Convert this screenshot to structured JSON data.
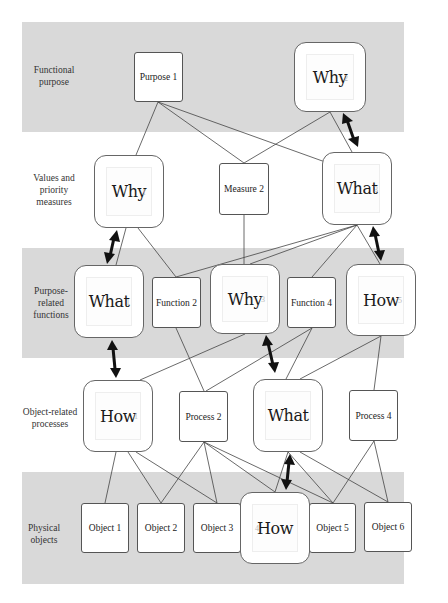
{
  "diagram": {
    "type": "abstraction-hierarchy",
    "levels": [
      {
        "id": "L1",
        "label": "Functional purpose",
        "label_lines": [
          "Functional",
          "purpose"
        ],
        "shaded": true
      },
      {
        "id": "L2",
        "label": "Values and priority measures",
        "label_lines": [
          "Values and",
          "priority",
          "measures"
        ],
        "shaded": false
      },
      {
        "id": "L3",
        "label": "Purpose-related functions",
        "label_lines": [
          "Purpose-",
          "related",
          "functions"
        ],
        "shaded": true
      },
      {
        "id": "L4",
        "label": "Object-related processes",
        "label_lines": [
          "Object-related",
          "processes"
        ],
        "shaded": false
      },
      {
        "id": "L5",
        "label": "Physical objects",
        "label_lines": [
          "Physical",
          "objects"
        ],
        "shaded": true
      }
    ],
    "nodes": {
      "purpose1": {
        "label": "Purpose 1",
        "kind": "plain"
      },
      "purpose2": {
        "label": "Why",
        "ghost": "2",
        "kind": "focus"
      },
      "measure1": {
        "label": "Why",
        "ghost": "1",
        "kind": "focus"
      },
      "measure2": {
        "label": "Measure 2",
        "kind": "plain"
      },
      "measure3": {
        "label": "What",
        "ghost": "3",
        "kind": "focus"
      },
      "function1": {
        "label": "What",
        "ghost": "1",
        "kind": "focus"
      },
      "function2": {
        "label": "Function 2",
        "kind": "plain"
      },
      "function3": {
        "label": "Why",
        "ghost": "3",
        "kind": "focus"
      },
      "function4": {
        "label": "Function 4",
        "kind": "plain"
      },
      "function5": {
        "label": "How",
        "ghost": "5",
        "kind": "focus"
      },
      "process1": {
        "label": "How",
        "ghost": "1",
        "kind": "focus"
      },
      "process2": {
        "label": "Process 2",
        "kind": "plain"
      },
      "process3": {
        "label": "What",
        "ghost": "3",
        "kind": "focus"
      },
      "process4": {
        "label": "Process 4",
        "kind": "plain"
      },
      "object1": {
        "label": "Object 1",
        "kind": "plain"
      },
      "object2": {
        "label": "Object 2",
        "kind": "plain"
      },
      "object3": {
        "label": "Object 3",
        "kind": "plain"
      },
      "object4": {
        "label": "How",
        "ghost": "4",
        "kind": "focus"
      },
      "object5": {
        "label": "Object 5",
        "kind": "plain"
      },
      "object6": {
        "label": "Object 6",
        "kind": "plain"
      }
    },
    "edges": [
      [
        "purpose1",
        "measure1"
      ],
      [
        "purpose1",
        "measure3"
      ],
      [
        "purpose1",
        "measure2"
      ],
      [
        "purpose2",
        "measure2"
      ],
      [
        "purpose2",
        "measure3"
      ],
      [
        "measure1",
        "function1"
      ],
      [
        "measure1",
        "function2"
      ],
      [
        "measure2",
        "function3"
      ],
      [
        "measure3",
        "function2"
      ],
      [
        "measure3",
        "function3"
      ],
      [
        "measure3",
        "function4"
      ],
      [
        "measure3",
        "function5"
      ],
      [
        "function1",
        "process1"
      ],
      [
        "function2",
        "process2"
      ],
      [
        "function3",
        "process1"
      ],
      [
        "function3",
        "process3"
      ],
      [
        "function4",
        "process3"
      ],
      [
        "function4",
        "process2"
      ],
      [
        "function5",
        "process3"
      ],
      [
        "function5",
        "process4"
      ],
      [
        "process1",
        "object1"
      ],
      [
        "process1",
        "object2"
      ],
      [
        "process1",
        "object3"
      ],
      [
        "process2",
        "object2"
      ],
      [
        "process2",
        "object3"
      ],
      [
        "process2",
        "object4"
      ],
      [
        "process2",
        "object5"
      ],
      [
        "process3",
        "object4"
      ],
      [
        "process3",
        "object5"
      ],
      [
        "process3",
        "object6"
      ],
      [
        "process4",
        "object5"
      ],
      [
        "process4",
        "object6"
      ]
    ],
    "bidirectional_arrows": [
      {
        "from": "purpose2",
        "to": "measure3",
        "meaning": "Why-What"
      },
      {
        "from": "measure1",
        "to": "function1",
        "meaning": "Why-What"
      },
      {
        "from": "measure3",
        "to": "function5",
        "meaning": "What-How"
      },
      {
        "from": "function1",
        "to": "process1",
        "meaning": "What-How"
      },
      {
        "from": "function3",
        "to": "process3",
        "meaning": "Why-What"
      },
      {
        "from": "process3",
        "to": "object4",
        "meaning": "What-How"
      }
    ]
  },
  "colors": {
    "band_fill": "#d9d9d9",
    "line": "#444444",
    "arrow": "#111111",
    "node_fill": "#ffffff"
  }
}
